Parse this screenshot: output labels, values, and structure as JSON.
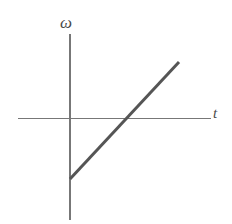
{
  "figure": {
    "name": "angular-velocity-vs-time-graph",
    "background_color": "#ffffff"
  },
  "axes": {
    "y": {
      "label": "ω",
      "icon": "vertical-axis-line",
      "color": "#777777",
      "x_px": 70,
      "y_top_px": 34,
      "y_bottom_px": 220
    },
    "x": {
      "label": "t",
      "icon": "horizontal-axis-line",
      "color": "#777777",
      "y_px": 118,
      "x_left_px": 18,
      "x_right_px": 211
    },
    "origin": {
      "x_px": 70,
      "y_px": 118
    }
  },
  "chart_data": {
    "type": "line",
    "title": "",
    "xlabel": "t",
    "ylabel": "ω",
    "grid": false,
    "legend": null,
    "annotations": [],
    "xlim": [
      -1.05,
      2.6
    ],
    "ylim": [
      -2.35,
      1.15
    ],
    "axis_tick_labels": {
      "x": [],
      "y": []
    },
    "series": [
      {
        "name": "omega(t)",
        "color": "#555555",
        "line_width_px": 3,
        "comment": "straight line with positive slope, negative intercept; crosses t-axis to the right of origin",
        "x": [
          0,
          1.5
        ],
        "y": [
          -0.82,
          0.77
        ],
        "points_px": [
          {
            "x": 70,
            "y": 179
          },
          {
            "x": 179,
            "y": 62
          }
        ],
        "x_intercept_px": 127,
        "y_intercept_px": 179,
        "slope_px_per_px": -1.073
      }
    ]
  }
}
